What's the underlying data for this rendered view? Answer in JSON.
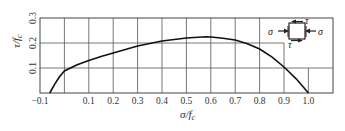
{
  "chart_data": {
    "type": "line",
    "title": "",
    "xlabel": "σ/f",
    "xlabel_sub": "c",
    "ylabel": "τ/f",
    "ylabel_sub": "c",
    "xlim": [
      -0.1,
      1.1
    ],
    "ylim": [
      0,
      0.3
    ],
    "grid": true,
    "legend": "none",
    "x_ticks": [
      {
        "value": -0.1,
        "label": "-0.1"
      },
      {
        "value": 0.0,
        "label": ""
      },
      {
        "value": 0.1,
        "label": "0.1"
      },
      {
        "value": 0.2,
        "label": "0.2"
      },
      {
        "value": 0.3,
        "label": "0.3"
      },
      {
        "value": 0.4,
        "label": "0.4"
      },
      {
        "value": 0.5,
        "label": "0.5"
      },
      {
        "value": 0.6,
        "label": "0.6"
      },
      {
        "value": 0.7,
        "label": "0.7"
      },
      {
        "value": 0.8,
        "label": "0.8"
      },
      {
        "value": 0.9,
        "label": "0.9"
      },
      {
        "value": 1.0,
        "label": "1.0"
      }
    ],
    "y_ticks": [
      {
        "value": 0.1,
        "label": "0.1"
      },
      {
        "value": 0.2,
        "label": "0.2"
      },
      {
        "value": 0.3,
        "label": "0.3"
      }
    ],
    "series": [
      {
        "name": "failure envelope",
        "x": [
          -0.06,
          -0.04,
          -0.02,
          0.0,
          0.05,
          0.1,
          0.15,
          0.2,
          0.3,
          0.4,
          0.5,
          0.58,
          0.6,
          0.65,
          0.7,
          0.75,
          0.8,
          0.85,
          0.9,
          0.95,
          1.0
        ],
        "y": [
          0.0,
          0.035,
          0.065,
          0.088,
          0.112,
          0.13,
          0.146,
          0.16,
          0.188,
          0.208,
          0.22,
          0.225,
          0.224,
          0.219,
          0.212,
          0.197,
          0.176,
          0.145,
          0.104,
          0.057,
          0.0
        ]
      }
    ],
    "inset": {
      "description": "element under compression σ and shear τ",
      "labels": {
        "sigma_left": "σ",
        "sigma_right": "σ",
        "tau_top": "τ",
        "tau_bottom": "τ"
      }
    }
  }
}
